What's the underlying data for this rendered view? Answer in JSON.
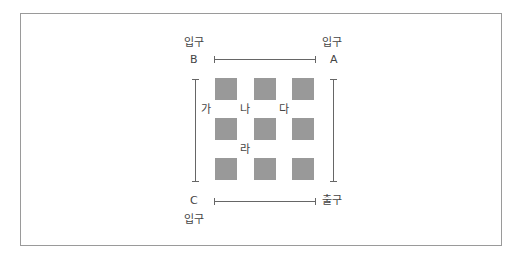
{
  "diagram": {
    "labels": {
      "top_left_gate": "입구",
      "top_left_letter": "B",
      "top_right_gate": "입구",
      "top_right_letter": "A",
      "bottom_left_letter": "C",
      "bottom_left_gate": "입구",
      "bottom_right_gate": "출구"
    },
    "zones": {
      "ga": "가",
      "na": "나",
      "da": "다",
      "ra": "라"
    },
    "grid": {
      "rows": 3,
      "cols": 3,
      "color": "#999999"
    }
  }
}
